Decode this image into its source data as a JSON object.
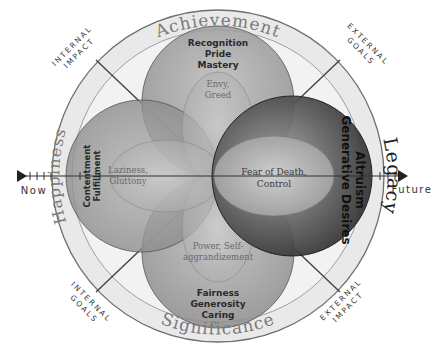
{
  "diagram": {
    "ring_labels": {
      "top": "Achievement",
      "left": "Happiness",
      "right": "Legacy",
      "bottom": "Significance"
    },
    "corner_labels": {
      "top_left": [
        "INTERNAL",
        "IMPACT"
      ],
      "top_right": [
        "EXTERNAL",
        "GOALS"
      ],
      "bottom_left": [
        "INTERNAL",
        "GOALS"
      ],
      "bottom_right": [
        "EXTERNAL",
        "IMPACT"
      ]
    },
    "timeline": {
      "start": "Now",
      "end": "Future"
    },
    "circles": {
      "achievement": {
        "positive": [
          "Recognition",
          "Pride",
          "Mastery"
        ],
        "negative": [
          "Envy,",
          "Greed"
        ]
      },
      "happiness": {
        "positive": [
          "Contentment",
          "Fulfillment"
        ],
        "negative": [
          "Laziness,",
          "Gluttony"
        ]
      },
      "legacy": {
        "positive": [
          "Altruism",
          "Generative Desires"
        ],
        "negative": [
          "Fear of Death,",
          "Control"
        ]
      },
      "significance": {
        "positive": [
          "Fairness",
          "Generosity",
          "Caring"
        ],
        "negative": [
          "Power, Self-",
          "aggrandizement"
        ]
      }
    },
    "colors": {
      "ring_fill": "#e8e8e8",
      "ring_stroke": "#6e6e6e",
      "circle_fill": "#9a9a9a",
      "legacy_dark": "#3a3a3a",
      "ring_text": "#777777",
      "label_text": "#333333"
    }
  }
}
